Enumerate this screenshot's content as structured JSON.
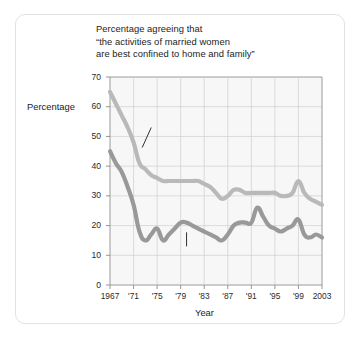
{
  "card": {
    "background_color": "#ffffff",
    "border_color": "#e2e2e2"
  },
  "chart_data": {
    "type": "line",
    "title": "Percentage agreeing that “the activities of married women are best confined to home and family”",
    "title_lines": [
      "Percentage agreeing that",
      "“the activities of married women",
      "are best confined to home and family”"
    ],
    "xlabel": "Year",
    "ylabel": "Percentage",
    "ylim": [
      0,
      70
    ],
    "ytick_values": [
      0,
      10,
      20,
      30,
      40,
      50,
      60,
      70
    ],
    "ytick_labels": [
      "0",
      "10",
      "20",
      "30",
      "40",
      "50",
      "60",
      "70"
    ],
    "xlim": [
      1967,
      2003
    ],
    "xtick_values": [
      1967,
      1971,
      1975,
      1979,
      1983,
      1987,
      1991,
      1995,
      1999,
      2003
    ],
    "xtick_labels": [
      "1967",
      "'71",
      "'75",
      "'79",
      "'83",
      "'87",
      "'91",
      "'95",
      "'99",
      "2003"
    ],
    "grid": true,
    "grid_color": "#cfcfcf",
    "plot_background": "#f7f7f7",
    "legend": "inline-annotations",
    "x": [
      1967,
      1968,
      1969,
      1970,
      1971,
      1972,
      1973,
      1974,
      1975,
      1976,
      1977,
      1978,
      1979,
      1980,
      1981,
      1982,
      1983,
      1984,
      1985,
      1986,
      1987,
      1988,
      1989,
      1990,
      1991,
      1992,
      1993,
      1994,
      1995,
      1996,
      1997,
      1998,
      1999,
      2000,
      2001,
      2002,
      2003
    ],
    "series": [
      {
        "name": "Men",
        "color": "#b9b9b9",
        "values": [
          65,
          61,
          57,
          53,
          48,
          41,
          39,
          37,
          36,
          35,
          35,
          35,
          35,
          35,
          35,
          35,
          34,
          33,
          31,
          29,
          30,
          32,
          32,
          31,
          31,
          31,
          31,
          31,
          31,
          30,
          30,
          31,
          35,
          31,
          29,
          28,
          27
        ]
      },
      {
        "name": "Women",
        "color": "#999999",
        "values": [
          45,
          41,
          38,
          33,
          27,
          18,
          15,
          17,
          19,
          15,
          17,
          19,
          21,
          21,
          20,
          19,
          18,
          17,
          16,
          15,
          17,
          20,
          21,
          21,
          21,
          26,
          23,
          20,
          19,
          18,
          19,
          20,
          22,
          17,
          16,
          17,
          16
        ]
      }
    ],
    "annotations": [
      {
        "text": "Men",
        "x_year": 1974,
        "y_value": 53
      },
      {
        "text": "Women",
        "x_year": 1980,
        "y_value": 12
      }
    ]
  }
}
